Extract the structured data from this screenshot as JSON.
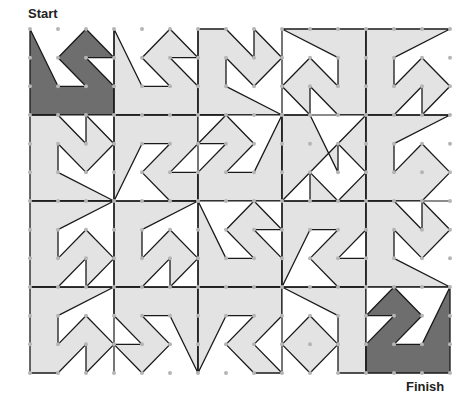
{
  "labels": {
    "start": "Start",
    "finish": "Finish"
  },
  "colors": {
    "light": "#e3e3e3",
    "dark": "#6e6e6e",
    "line": "#1a1a1a",
    "dot": "#b5b5b5",
    "background": "#ffffff"
  },
  "grid": {
    "dot_columns": 16,
    "dot_rows": 13,
    "tile_columns": 5,
    "tile_rows": 4,
    "units_per_tile": 3
  },
  "tiles": [
    {
      "id": "r1c1",
      "fill": "dark",
      "poly": [
        [
          0,
          0
        ],
        [
          1,
          2
        ],
        [
          2,
          2
        ],
        [
          1,
          1
        ],
        [
          2,
          0
        ],
        [
          3,
          1
        ],
        [
          2,
          1
        ],
        [
          3,
          2
        ],
        [
          3,
          3
        ],
        [
          0,
          3
        ]
      ]
    },
    {
      "id": "r1c2",
      "fill": "light",
      "poly": [
        [
          3,
          0
        ],
        [
          4,
          2
        ],
        [
          5,
          2
        ],
        [
          4,
          1
        ],
        [
          5,
          0
        ],
        [
          6,
          1
        ],
        [
          5,
          1
        ],
        [
          6,
          2
        ],
        [
          6,
          3
        ],
        [
          3,
          3
        ]
      ]
    },
    {
      "id": "r1c3",
      "fill": "light",
      "poly": [
        [
          6,
          0
        ],
        [
          7,
          0
        ],
        [
          8,
          1
        ],
        [
          8,
          0
        ],
        [
          9,
          1
        ],
        [
          8,
          2
        ],
        [
          7,
          1
        ],
        [
          7,
          2
        ],
        [
          9,
          3
        ],
        [
          6,
          3
        ]
      ]
    },
    {
      "id": "r1c4",
      "fill": "light",
      "poly": [
        [
          9,
          0
        ],
        [
          12,
          0
        ],
        [
          12,
          3
        ],
        [
          11,
          3
        ],
        [
          10,
          2
        ],
        [
          10,
          3
        ],
        [
          9,
          2
        ],
        [
          10,
          1
        ],
        [
          11,
          2
        ],
        [
          11,
          1
        ]
      ]
    },
    {
      "id": "r1c5",
      "fill": "light",
      "poly": [
        [
          12,
          0
        ],
        [
          15,
          0
        ],
        [
          13,
          1
        ],
        [
          13,
          2
        ],
        [
          14,
          1
        ],
        [
          15,
          2
        ],
        [
          14,
          3
        ],
        [
          14,
          2
        ],
        [
          13,
          3
        ],
        [
          12,
          3
        ]
      ]
    },
    {
      "id": "r2c1",
      "fill": "light",
      "poly": [
        [
          0,
          3
        ],
        [
          1,
          3
        ],
        [
          2,
          4
        ],
        [
          2,
          3
        ],
        [
          3,
          4
        ],
        [
          2,
          5
        ],
        [
          1,
          4
        ],
        [
          1,
          5
        ],
        [
          3,
          6
        ],
        [
          0,
          6
        ]
      ]
    },
    {
      "id": "r2c2",
      "fill": "light",
      "poly": [
        [
          3,
          3
        ],
        [
          6,
          3
        ],
        [
          6,
          4
        ],
        [
          5,
          5
        ],
        [
          6,
          5
        ],
        [
          6,
          6
        ],
        [
          5,
          6
        ],
        [
          4,
          5
        ],
        [
          5,
          4
        ],
        [
          4,
          4
        ],
        [
          3,
          6
        ]
      ]
    },
    {
      "id": "r2c3",
      "fill": "light",
      "poly": [
        [
          6,
          3
        ],
        [
          7,
          3
        ],
        [
          6,
          4
        ],
        [
          7,
          4
        ],
        [
          6,
          5
        ],
        [
          6,
          6
        ],
        [
          9,
          6
        ],
        [
          9,
          3
        ],
        [
          8,
          5
        ],
        [
          7,
          5
        ],
        [
          8,
          4
        ],
        [
          7,
          3
        ]
      ]
    },
    {
      "id": "r2c4",
      "fill": "light",
      "poly": [
        [
          9,
          3
        ],
        [
          10,
          3
        ],
        [
          11,
          5
        ],
        [
          11,
          4
        ],
        [
          12,
          5
        ],
        [
          11,
          6
        ],
        [
          10,
          5
        ],
        [
          10,
          6
        ],
        [
          12,
          6
        ],
        [
          12,
          3
        ],
        [
          9,
          6
        ]
      ]
    },
    {
      "id": "r2c5",
      "fill": "light",
      "poly": [
        [
          12,
          3
        ],
        [
          15,
          3
        ],
        [
          13,
          4
        ],
        [
          13,
          5
        ],
        [
          14,
          4
        ],
        [
          15,
          5
        ],
        [
          14,
          6
        ],
        [
          12,
          6
        ]
      ]
    },
    {
      "id": "r3c1",
      "fill": "light",
      "poly": [
        [
          0,
          6
        ],
        [
          3,
          6
        ],
        [
          1,
          7
        ],
        [
          1,
          8
        ],
        [
          2,
          7
        ],
        [
          3,
          8
        ],
        [
          2,
          9
        ],
        [
          2,
          8
        ],
        [
          1,
          9
        ],
        [
          0,
          9
        ]
      ]
    },
    {
      "id": "r3c2",
      "fill": "light",
      "poly": [
        [
          3,
          6
        ],
        [
          6,
          6
        ],
        [
          4,
          7
        ],
        [
          4,
          8
        ],
        [
          5,
          7
        ],
        [
          6,
          8
        ],
        [
          5,
          9
        ],
        [
          5,
          8
        ],
        [
          4,
          9
        ],
        [
          3,
          9
        ]
      ]
    },
    {
      "id": "r3c3",
      "fill": "light",
      "poly": [
        [
          6,
          6
        ],
        [
          7,
          8
        ],
        [
          8,
          8
        ],
        [
          7,
          7
        ],
        [
          8,
          6
        ],
        [
          9,
          7
        ],
        [
          8,
          7
        ],
        [
          9,
          8
        ],
        [
          9,
          9
        ],
        [
          6,
          9
        ]
      ]
    },
    {
      "id": "r3c4",
      "fill": "light",
      "poly": [
        [
          9,
          6
        ],
        [
          12,
          6
        ],
        [
          12,
          7
        ],
        [
          11,
          8
        ],
        [
          12,
          8
        ],
        [
          12,
          9
        ],
        [
          11,
          9
        ],
        [
          10,
          8
        ],
        [
          11,
          7
        ],
        [
          10,
          7
        ],
        [
          9,
          9
        ]
      ]
    },
    {
      "id": "r3c5",
      "fill": "light",
      "poly": [
        [
          12,
          6
        ],
        [
          13,
          6
        ],
        [
          14,
          7
        ],
        [
          14,
          6
        ],
        [
          15,
          7
        ],
        [
          14,
          8
        ],
        [
          13,
          7
        ],
        [
          13,
          8
        ],
        [
          15,
          9
        ],
        [
          12,
          9
        ]
      ]
    },
    {
      "id": "r4c1",
      "fill": "light",
      "poly": [
        [
          0,
          9
        ],
        [
          3,
          9
        ],
        [
          1,
          10
        ],
        [
          1,
          11
        ],
        [
          2,
          10
        ],
        [
          3,
          11
        ],
        [
          2,
          12
        ],
        [
          2,
          11
        ],
        [
          1,
          12
        ],
        [
          0,
          12
        ]
      ]
    },
    {
      "id": "r4c2",
      "fill": "light",
      "poly": [
        [
          3,
          9
        ],
        [
          6,
          9
        ],
        [
          6,
          12
        ],
        [
          5,
          10
        ],
        [
          4,
          10
        ],
        [
          5,
          11
        ],
        [
          4,
          12
        ],
        [
          3,
          11
        ],
        [
          4,
          11
        ],
        [
          3,
          10
        ]
      ]
    },
    {
      "id": "r4c3",
      "fill": "light",
      "poly": [
        [
          6,
          9
        ],
        [
          9,
          9
        ],
        [
          9,
          10
        ],
        [
          8,
          11
        ],
        [
          9,
          12
        ],
        [
          8,
          12
        ],
        [
          7,
          11
        ],
        [
          8,
          10
        ],
        [
          7,
          10
        ],
        [
          6,
          12
        ]
      ]
    },
    {
      "id": "r4c4",
      "fill": "light",
      "poly": [
        [
          9,
          9
        ],
        [
          12,
          9
        ],
        [
          12,
          12
        ],
        [
          11,
          12
        ],
        [
          11,
          11
        ],
        [
          10,
          12
        ],
        [
          9,
          11
        ],
        [
          10,
          10
        ],
        [
          11,
          11
        ],
        [
          11,
          10
        ]
      ]
    },
    {
      "id": "r4c5",
      "fill": "dark",
      "poly": [
        [
          12,
          10
        ],
        [
          13,
          9
        ],
        [
          14,
          10
        ],
        [
          13,
          11
        ],
        [
          14,
          11
        ],
        [
          15,
          9
        ],
        [
          15,
          12
        ],
        [
          12,
          12
        ],
        [
          12,
          11
        ],
        [
          13,
          10
        ]
      ]
    }
  ]
}
